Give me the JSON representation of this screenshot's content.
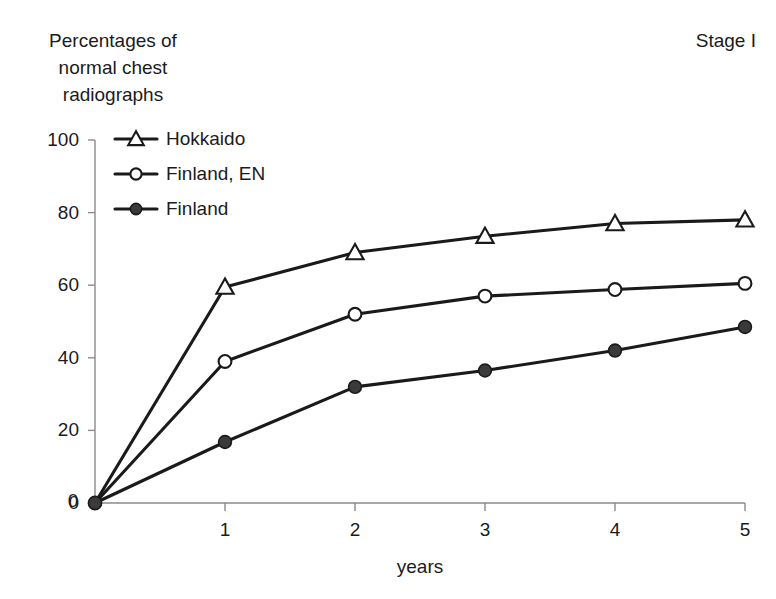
{
  "chart_data": {
    "type": "line",
    "title": "Percentages of\nnormal chest\nradiographs",
    "annotation": "Stage I",
    "xlabel": "years",
    "ylabel": "Percentages of normal chest radiographs",
    "x": [
      0,
      1,
      2,
      3,
      4,
      5
    ],
    "xlim": [
      0,
      5
    ],
    "ylim": [
      0,
      100
    ],
    "xticks": [
      "0",
      "1",
      "2",
      "3",
      "4",
      "5"
    ],
    "yticks": [
      "0",
      "20",
      "40",
      "60",
      "80",
      "100"
    ],
    "grid": false,
    "legend_position": "upper left",
    "series": [
      {
        "name": "Hokkaido",
        "marker": "open-triangle",
        "values": [
          0,
          59.5,
          69,
          73.5,
          77,
          78
        ]
      },
      {
        "name": "Finland, EN",
        "marker": "open-circle",
        "values": [
          0,
          39,
          52,
          57,
          58.8,
          60.5
        ]
      },
      {
        "name": "Finland",
        "marker": "filled-circle",
        "values": [
          0,
          16.8,
          32,
          36.5,
          42,
          48.5
        ]
      }
    ]
  },
  "style": {
    "line_color": "#1a1a1a",
    "axis_color": "#8a8a8a",
    "text_color": "#1b1b1b",
    "marker_fill_open": "#ffffff",
    "marker_fill_closed": "#3a3a3a"
  }
}
